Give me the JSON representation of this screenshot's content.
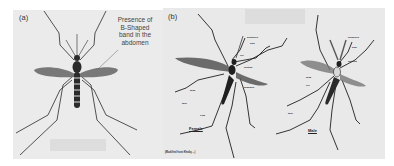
{
  "figure": {
    "panel_a": {
      "label": "(a)",
      "annotation_lines": [
        "Presence of",
        "B-Shaped",
        "band in the",
        "abdomen"
      ]
    },
    "panel_b": {
      "label": "(b)",
      "female_caption": "Female",
      "male_caption": "Male",
      "citation": "(Modified from Khaliq ...)"
    }
  },
  "colors": {
    "background": "#ebebeb",
    "ink": "#2a2a2a",
    "wing": "#6b6b6b"
  }
}
